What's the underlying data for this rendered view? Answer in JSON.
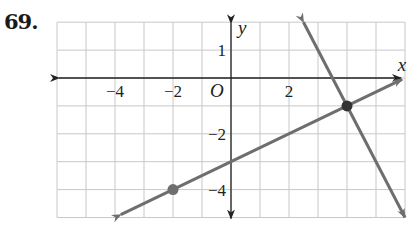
{
  "problem": {
    "number": "69."
  },
  "chart_data": {
    "type": "line",
    "title": "",
    "xlabel": "x",
    "ylabel": "y",
    "origin_label": "O",
    "xlim": [
      -6,
      6
    ],
    "ylim": [
      -5,
      2
    ],
    "grid": true,
    "x_tick_labels": [
      {
        "value": -4,
        "label": "−4"
      },
      {
        "value": -2,
        "label": "−2"
      },
      {
        "value": 2,
        "label": "2"
      }
    ],
    "y_tick_labels": [
      {
        "value": 1,
        "label": "1"
      },
      {
        "value": -2,
        "label": "−2"
      },
      {
        "value": -4,
        "label": "−4"
      }
    ],
    "series": [
      {
        "name": "line-1",
        "equation": "y = 0.5x - 3",
        "slope": 0.5,
        "intercept": -3,
        "x_range": [
          -3.8,
          5.9
        ],
        "color": "#6e6e6e"
      },
      {
        "name": "line-2",
        "equation": "y = -2x + 7",
        "slope": -2,
        "intercept": 7,
        "x_range": [
          2.5,
          6
        ],
        "color": "#6e6e6e"
      }
    ],
    "points": [
      {
        "x": -2,
        "y": -4,
        "color": "#6e6e6e"
      },
      {
        "x": 4,
        "y": -1,
        "color": "#333333"
      }
    ]
  }
}
